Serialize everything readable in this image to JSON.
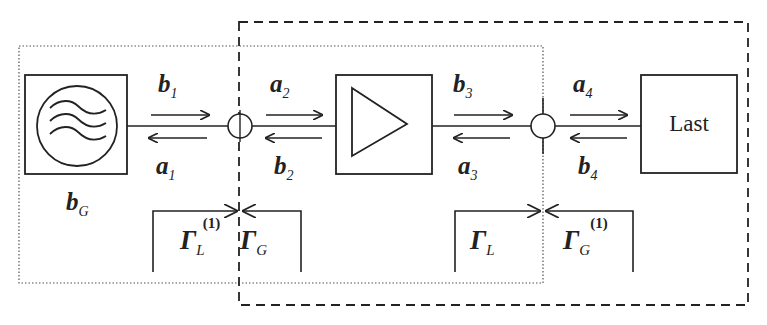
{
  "diagram": {
    "type": "block-diagram",
    "title": "",
    "blocks": [
      {
        "id": "generator",
        "label": "",
        "icon": "sine-wave-source-icon",
        "source_wave_label": {
          "main": "b",
          "sub": "G"
        }
      },
      {
        "id": "amplifier",
        "label": "",
        "icon": "amplifier-triangle-icon"
      },
      {
        "id": "load",
        "label": "Last"
      }
    ],
    "waves": [
      {
        "main": "b",
        "sub": "1",
        "direction": "right"
      },
      {
        "main": "a",
        "sub": "1",
        "direction": "left"
      },
      {
        "main": "a",
        "sub": "2",
        "direction": "right"
      },
      {
        "main": "b",
        "sub": "2",
        "direction": "left"
      },
      {
        "main": "b",
        "sub": "3",
        "direction": "right"
      },
      {
        "main": "a",
        "sub": "3",
        "direction": "left"
      },
      {
        "main": "a",
        "sub": "4",
        "direction": "right"
      },
      {
        "main": "b",
        "sub": "4",
        "direction": "left"
      }
    ],
    "reflection_coefficients": [
      {
        "main": "Γ",
        "sub": "L",
        "sup": "(1)"
      },
      {
        "main": "Γ",
        "sub": "G",
        "sup": ""
      },
      {
        "main": "Γ",
        "sub": "L",
        "sup": ""
      },
      {
        "main": "Γ",
        "sub": "G",
        "sup": "(1)"
      }
    ],
    "regions": [
      {
        "id": "dotted-region",
        "style": "dotted",
        "encloses": [
          "generator",
          "amplifier"
        ]
      },
      {
        "id": "dashed-region",
        "style": "dashed",
        "encloses": [
          "amplifier",
          "load"
        ]
      }
    ],
    "colors": {
      "line": "#222222",
      "background": "#ffffff"
    }
  }
}
